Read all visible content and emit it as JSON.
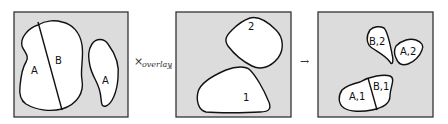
{
  "diagram": {
    "operator": {
      "symbol": "×",
      "name": "overlay",
      "subscript": "1"
    },
    "arrow": "→",
    "panels": [
      {
        "id": "input-left",
        "regions": [
          {
            "label": "A"
          },
          {
            "label": "B"
          },
          {
            "label": "A"
          }
        ]
      },
      {
        "id": "input-right",
        "regions": [
          {
            "label": "2"
          },
          {
            "label": "1"
          }
        ]
      },
      {
        "id": "result",
        "regions": [
          {
            "label": "B,2"
          },
          {
            "label": "A,2"
          },
          {
            "label": "B,1"
          },
          {
            "label": "A,1"
          }
        ]
      }
    ],
    "colors": {
      "panel_fill": "#dcdcdc",
      "shape_fill": "#ffffff",
      "stroke": "#111111"
    }
  }
}
